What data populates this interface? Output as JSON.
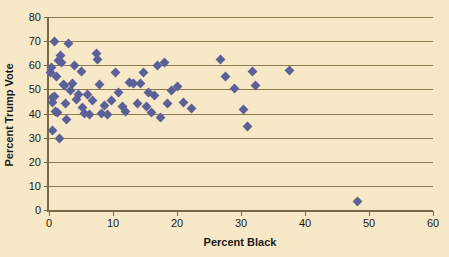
{
  "chart_data": {
    "type": "scatter",
    "title": "",
    "xlabel": "Percent Black",
    "ylabel": "Percent Trump Vote",
    "xlim": [
      0,
      60
    ],
    "ylim": [
      0,
      80
    ],
    "xticks": [
      0,
      10,
      20,
      30,
      40,
      50,
      60
    ],
    "yticks": [
      0,
      10,
      20,
      30,
      40,
      50,
      60,
      70,
      80
    ],
    "grid": "horizontal",
    "legend": "none",
    "marker": "diamond",
    "marker_color": "#5b6098",
    "background_color": "#f7e8c8",
    "axis_color": "#7a6a44",
    "points": [
      {
        "x": 0.3,
        "y": 57.0
      },
      {
        "x": 0.4,
        "y": 59.0
      },
      {
        "x": 0.5,
        "y": 46.5
      },
      {
        "x": 0.5,
        "y": 44.5
      },
      {
        "x": 0.6,
        "y": 33.0
      },
      {
        "x": 0.8,
        "y": 70.0
      },
      {
        "x": 0.9,
        "y": 47.0
      },
      {
        "x": 1.0,
        "y": 41.0
      },
      {
        "x": 1.1,
        "y": 55.5
      },
      {
        "x": 1.3,
        "y": 40.5
      },
      {
        "x": 1.5,
        "y": 62.0
      },
      {
        "x": 1.6,
        "y": 29.5
      },
      {
        "x": 1.8,
        "y": 64.0
      },
      {
        "x": 2.0,
        "y": 61.0
      },
      {
        "x": 2.2,
        "y": 52.0
      },
      {
        "x": 2.4,
        "y": 51.5
      },
      {
        "x": 2.6,
        "y": 44.0
      },
      {
        "x": 2.8,
        "y": 37.5
      },
      {
        "x": 3.1,
        "y": 69.0
      },
      {
        "x": 3.3,
        "y": 49.5
      },
      {
        "x": 3.6,
        "y": 52.5
      },
      {
        "x": 4.0,
        "y": 60.0
      },
      {
        "x": 4.3,
        "y": 46.0
      },
      {
        "x": 4.6,
        "y": 48.0
      },
      {
        "x": 5.0,
        "y": 57.5
      },
      {
        "x": 5.2,
        "y": 42.5
      },
      {
        "x": 5.6,
        "y": 40.0
      },
      {
        "x": 6.0,
        "y": 48.0
      },
      {
        "x": 6.4,
        "y": 39.5
      },
      {
        "x": 6.8,
        "y": 45.5
      },
      {
        "x": 7.4,
        "y": 65.0
      },
      {
        "x": 7.6,
        "y": 62.5
      },
      {
        "x": 7.9,
        "y": 52.0
      },
      {
        "x": 8.2,
        "y": 40.0
      },
      {
        "x": 8.6,
        "y": 43.5
      },
      {
        "x": 9.2,
        "y": 39.5
      },
      {
        "x": 9.8,
        "y": 45.5
      },
      {
        "x": 10.4,
        "y": 57.0
      },
      {
        "x": 10.9,
        "y": 48.5
      },
      {
        "x": 11.5,
        "y": 43.0
      },
      {
        "x": 12.0,
        "y": 41.0
      },
      {
        "x": 12.6,
        "y": 53.0
      },
      {
        "x": 13.2,
        "y": 52.5
      },
      {
        "x": 13.8,
        "y": 44.0
      },
      {
        "x": 14.3,
        "y": 52.5
      },
      {
        "x": 14.8,
        "y": 57.0
      },
      {
        "x": 15.2,
        "y": 43.0
      },
      {
        "x": 15.6,
        "y": 48.5
      },
      {
        "x": 16.0,
        "y": 40.5
      },
      {
        "x": 16.5,
        "y": 47.5
      },
      {
        "x": 16.9,
        "y": 60.0
      },
      {
        "x": 17.4,
        "y": 38.5
      },
      {
        "x": 18.0,
        "y": 61.0
      },
      {
        "x": 18.5,
        "y": 44.0
      },
      {
        "x": 19.2,
        "y": 49.5
      },
      {
        "x": 20.0,
        "y": 51.0
      },
      {
        "x": 21.0,
        "y": 44.5
      },
      {
        "x": 22.3,
        "y": 42.0
      },
      {
        "x": 26.8,
        "y": 62.5
      },
      {
        "x": 27.5,
        "y": 55.5
      },
      {
        "x": 29.0,
        "y": 50.5
      },
      {
        "x": 30.4,
        "y": 41.5
      },
      {
        "x": 31.0,
        "y": 34.5
      },
      {
        "x": 31.8,
        "y": 57.5
      },
      {
        "x": 32.3,
        "y": 51.5
      },
      {
        "x": 37.5,
        "y": 58.0
      },
      {
        "x": 48.2,
        "y": 3.5
      }
    ]
  }
}
